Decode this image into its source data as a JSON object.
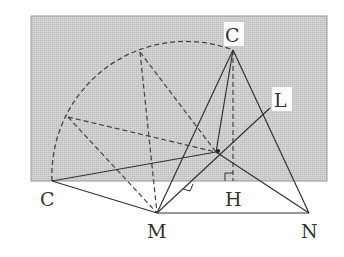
{
  "diagram": {
    "colors": {
      "background": "#ffffff",
      "rect_fill": "#c8c8c8",
      "line": "#333333"
    },
    "labels": {
      "C_top": "C",
      "C_left": "C",
      "L": "L",
      "M": "M",
      "H": "H",
      "N": "N"
    },
    "points": {
      "C_top": [
        233,
        50
      ],
      "C_left": [
        52,
        181
      ],
      "M": [
        157,
        213
      ],
      "N": [
        309,
        213
      ],
      "H": [
        233,
        181
      ],
      "P": [
        216,
        152
      ],
      "L_end": [
        270,
        108
      ],
      "A1": [
        68,
        117
      ],
      "A2": [
        140,
        52
      ]
    }
  }
}
